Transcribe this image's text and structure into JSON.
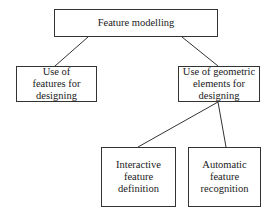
{
  "diagram": {
    "type": "tree",
    "nodes": [
      {
        "id": "root",
        "label": "Feature modelling"
      },
      {
        "id": "left",
        "label": "Use of\nfeatures for\ndesigning"
      },
      {
        "id": "right",
        "label": "Use of geometric\nelements for\ndesigning"
      },
      {
        "id": "bl",
        "label": "Interactive\nfeature\ndefinition"
      },
      {
        "id": "br",
        "label": "Automatic\nfeature\nrecognition"
      }
    ],
    "edges": [
      [
        "root",
        "left"
      ],
      [
        "root",
        "right"
      ],
      [
        "right",
        "bl"
      ],
      [
        "right",
        "br"
      ]
    ]
  }
}
